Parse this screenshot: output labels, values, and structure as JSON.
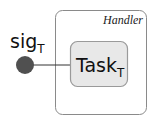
{
  "diagram": {
    "type": "plate-notation",
    "plate": {
      "label": "Handler",
      "border_color": "#8a8a8a"
    },
    "node_task": {
      "label": "Task",
      "subscript": "T",
      "fill": "#e8e8e8",
      "border_color": "#9a9a9a"
    },
    "node_signal": {
      "label": "sig",
      "subscript": "T",
      "fill": "#505050"
    },
    "edges": [
      {
        "from": "sig_T",
        "to": "Task_T"
      }
    ]
  }
}
